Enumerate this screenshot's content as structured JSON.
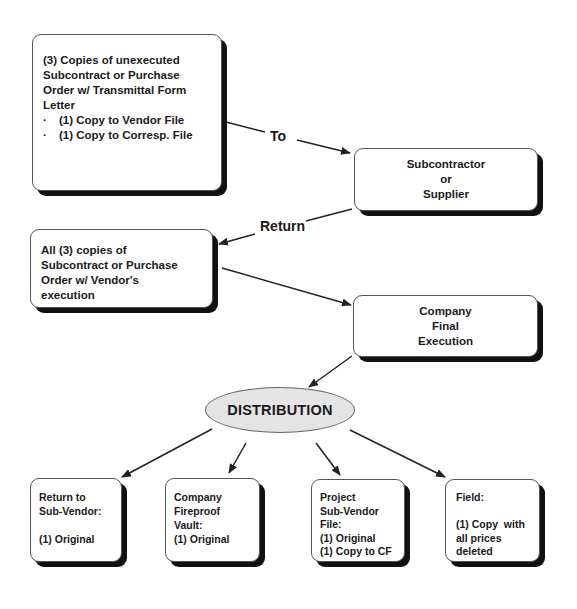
{
  "diagram": {
    "type": "flowchart",
    "nodes": {
      "unexecuted": {
        "lines": [
          "(3) Copies of unexecuted",
          "Subcontract or Purchase",
          "Order w/ Transmittal Form",
          "Letter"
        ],
        "bullets": [
          "(1) Copy to Vendor File",
          "(1) Copy to Corresp. File"
        ],
        "bullet_glyph": "·"
      },
      "subcontractor": {
        "lines": [
          "Subcontractor",
          "or",
          "Supplier"
        ]
      },
      "returned": {
        "lines": [
          "All (3) copies of",
          "Subcontract or Purchase",
          "Order w/ Vendor's",
          "execution"
        ]
      },
      "final_execution": {
        "lines": [
          "Company",
          "Final",
          "Execution"
        ]
      },
      "distribution": {
        "label": "DISTRIBUTION"
      },
      "return_to_vendor": {
        "lines": [
          "Return to",
          "Sub-Vendor:",
          "",
          "(1) Original"
        ]
      },
      "fireproof_vault": {
        "lines": [
          "Company",
          "Fireproof",
          "Vault:",
          "(1) Original"
        ]
      },
      "project_file": {
        "lines": [
          "Project",
          "Sub-Vendor",
          "File:",
          "(1) Original",
          "(1) Copy to CF"
        ]
      },
      "field": {
        "lines": [
          "Field:",
          "",
          "(1) Copy  with",
          "all prices",
          "deleted"
        ]
      }
    },
    "edges": [
      {
        "from": "unexecuted",
        "to": "subcontractor",
        "label": "To"
      },
      {
        "from": "subcontractor",
        "to": "returned",
        "label": "Return"
      },
      {
        "from": "returned",
        "to": "final_execution",
        "label": ""
      },
      {
        "from": "final_execution",
        "to": "distribution",
        "label": ""
      },
      {
        "from": "distribution",
        "to": "return_to_vendor",
        "label": ""
      },
      {
        "from": "distribution",
        "to": "fireproof_vault",
        "label": ""
      },
      {
        "from": "distribution",
        "to": "project_file",
        "label": ""
      },
      {
        "from": "distribution",
        "to": "field",
        "label": ""
      }
    ],
    "colors": {
      "ellipse_fill": "#e4e4e4",
      "shadow": "#111111",
      "line": "#222222"
    }
  }
}
